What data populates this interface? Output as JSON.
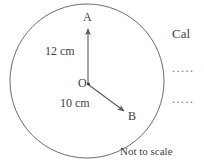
{
  "figure": {
    "type": "geometry-diagram",
    "shape": "circle",
    "caption": "Not to scale",
    "center_label": "O",
    "points": [
      {
        "name": "A",
        "label": "A",
        "direction": "up",
        "radius_label": "12 cm",
        "radius_value": 12,
        "unit": "cm"
      },
      {
        "name": "B",
        "label": "B",
        "direction": "down-right",
        "radius_label": "10 cm",
        "radius_value": 10,
        "unit": "cm"
      }
    ],
    "labels": {
      "a": "A",
      "b": "B",
      "o": "O",
      "oa_length": "12 cm",
      "ob_length": "10 cm"
    },
    "colors": {
      "stroke": "#5a5a5a",
      "text": "#3f3f3f",
      "background": "#ffffff"
    }
  },
  "side_panel": {
    "heading_visible_text": "Cal",
    "answer_lines": [
      {
        "text": "....."
      },
      {
        "text": "....."
      }
    ]
  }
}
